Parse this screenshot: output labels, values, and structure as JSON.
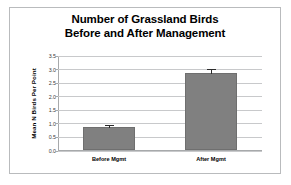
{
  "chart_data": {
    "type": "bar",
    "title": "Number of Grassland Birds Before and After Management",
    "title_lines": [
      "Number of Grassland Birds",
      "Before and After Management"
    ],
    "xlabel": "",
    "ylabel": "Mean N Birds Per Point",
    "categories": [
      "Before Mgmt",
      "After Mgmt"
    ],
    "values": [
      0.83,
      2.82
    ],
    "errors": [
      0.12,
      0.19
    ],
    "ylim": [
      0.0,
      3.5
    ],
    "ytick_labels": [
      "0.0",
      "0.5",
      "1.0",
      "1.5",
      "2.0",
      "2.5",
      "3.0",
      "3.5"
    ],
    "ytick_values": [
      0.0,
      0.5,
      1.0,
      1.5,
      2.0,
      2.5,
      3.0,
      3.5
    ],
    "grid": "horizontal",
    "legend": "none",
    "bar_color": "#808080",
    "error_color": "#2b2b2b",
    "gridline_color": "#c8c9cb",
    "axis_color": "#a7a9ab",
    "background": "#ffffff",
    "frame_color": "#b9bbbd"
  }
}
